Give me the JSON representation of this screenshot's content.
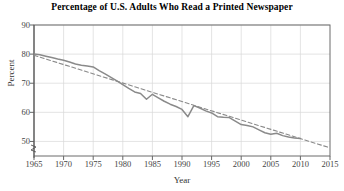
{
  "chart_data": {
    "type": "line",
    "title": "Percentage of U.S. Adults Who Read a Printed Newspaper",
    "xlabel": "Year",
    "ylabel": "Percent",
    "xlim": [
      1965,
      2015
    ],
    "ylim": [
      45,
      90
    ],
    "xticks": [
      1965,
      1970,
      1975,
      1980,
      1985,
      1990,
      1995,
      2000,
      2005,
      2010,
      2015
    ],
    "yticks": [
      50,
      60,
      70,
      80,
      90
    ],
    "grid": true,
    "legend": "none",
    "axis_break": true,
    "series": [
      {
        "name": "Percent of U.S. adults reading a printed newspaper",
        "style": "solid",
        "color": "#8a8a8a",
        "x": [
          1965,
          1966,
          1967,
          1968,
          1969,
          1970,
          1971,
          1972,
          1973,
          1974,
          1975,
          1976,
          1977,
          1978,
          1979,
          1980,
          1981,
          1982,
          1983,
          1984,
          1985,
          1986,
          1987,
          1988,
          1989,
          1990,
          1991,
          1992,
          1993,
          1994,
          1995,
          1996,
          1997,
          1998,
          1999,
          2000,
          2001,
          2002,
          2003,
          2004,
          2005,
          2006,
          2007,
          2008,
          2009,
          2010
        ],
        "y": [
          80.0,
          79.8,
          79.3,
          78.8,
          78.3,
          77.9,
          77.3,
          76.6,
          76.2,
          75.9,
          75.6,
          74.3,
          73.2,
          72.0,
          70.8,
          69.5,
          68.2,
          67.0,
          66.5,
          64.5,
          66.2,
          65.0,
          63.8,
          62.8,
          62.0,
          61.0,
          58.5,
          62.3,
          61.5,
          60.5,
          59.8,
          58.5,
          58.3,
          58.2,
          57.0,
          55.8,
          55.5,
          55.0,
          54.0,
          53.0,
          52.5,
          52.8,
          52.0,
          51.5,
          51.2,
          51.0
        ]
      },
      {
        "name": "Linear trend line",
        "style": "dashed",
        "color": "#8a8a8a",
        "x": [
          1965,
          2015
        ],
        "y": [
          79.6,
          47.8
        ]
      }
    ]
  },
  "axes": {
    "tick_labels_x": [
      "1965",
      "1970",
      "1975",
      "1980",
      "1985",
      "1990",
      "1995",
      "2000",
      "2005",
      "2010",
      "2015"
    ],
    "tick_labels_y": [
      "90",
      "80",
      "70",
      "60",
      "50"
    ]
  }
}
